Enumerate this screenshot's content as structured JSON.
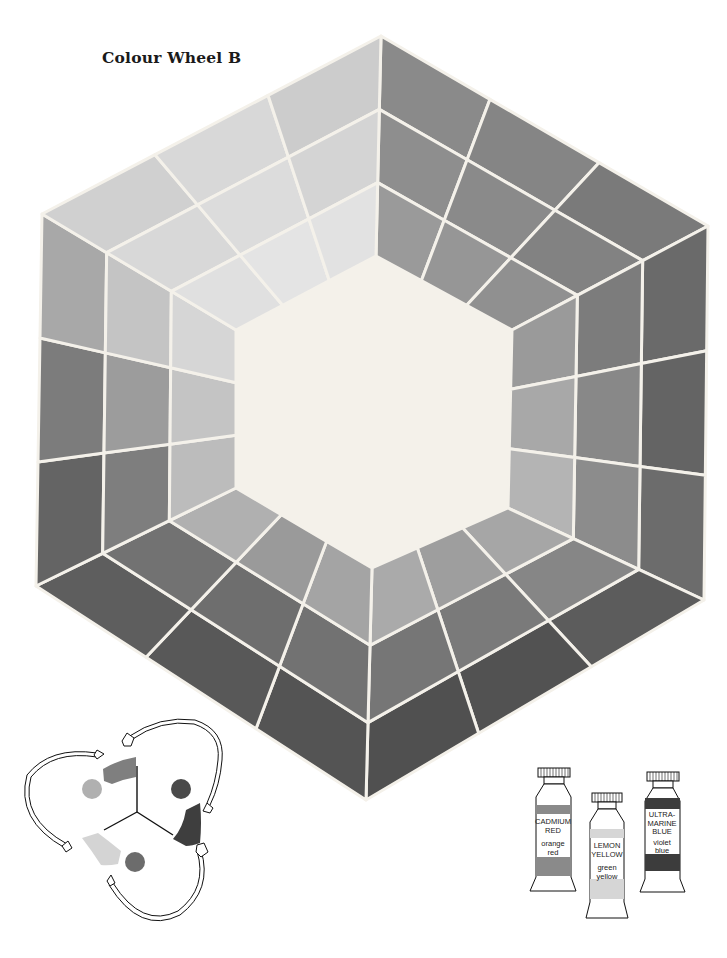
{
  "title": "Colour Wheel B",
  "wheel": {
    "outer_vertices": [
      [
        381,
        36
      ],
      [
        708,
        226
      ],
      [
        704,
        600
      ],
      [
        366,
        800
      ],
      [
        36,
        586
      ],
      [
        42,
        214
      ]
    ],
    "inner_vertices": [
      [
        376,
        256
      ],
      [
        512,
        330
      ],
      [
        508,
        508
      ],
      [
        372,
        568
      ],
      [
        236,
        488
      ],
      [
        236,
        330
      ]
    ],
    "rings": 3,
    "cells_per_side": 3,
    "gap_color": "#f4f1ea",
    "cell_grays": [
      [
        "#8a8a8a",
        "#8e8e8e",
        "#9a9a9a"
      ],
      [
        "#858585",
        "#8a8a8a",
        "#969696"
      ],
      [
        "#7a7a7a",
        "#828282",
        "#909090"
      ],
      [
        "#6a6a6a",
        "#7c7c7c",
        "#9a9a9a"
      ],
      [
        "#646464",
        "#888888",
        "#a8a8a8"
      ],
      [
        "#6c6c6c",
        "#8c8c8c",
        "#b4b4b4"
      ],
      [
        "#5c5c5c",
        "#868686",
        "#a6a6a6"
      ],
      [
        "#525252",
        "#7a7a7a",
        "#9e9e9e"
      ],
      [
        "#505050",
        "#767676",
        "#aaaaaa"
      ],
      [
        "#545454",
        "#727272",
        "#a4a4a4"
      ],
      [
        "#585858",
        "#6e6e6e",
        "#9a9a9a"
      ],
      [
        "#5e5e5e",
        "#727272",
        "#b0b0b0"
      ],
      [
        "#646464",
        "#7e7e7e",
        "#bcbcbc"
      ],
      [
        "#7c7c7c",
        "#9c9c9c",
        "#c4c4c4"
      ],
      [
        "#a8a8a8",
        "#c4c4c4",
        "#d6d6d6"
      ],
      [
        "#d0d0d0",
        "#d8d8d8",
        "#e0e0e0"
      ],
      [
        "#d8d8d8",
        "#dcdcdc",
        "#e4e4e4"
      ],
      [
        "#cccccc",
        "#d4d4d4",
        "#e2e2e2"
      ]
    ],
    "left_side_grays": [
      [
        "#8c8c8c",
        "#989898",
        "#a6a6a6"
      ],
      [
        "#8a8a8a",
        "#9e9e9e",
        "#b2b2b2"
      ],
      [
        "#929292",
        "#a4a4a4",
        "#c4c4c4"
      ]
    ]
  },
  "legend_diagram": {
    "swatches": [
      {
        "name": "orange-red-swatch",
        "color": "#7f7f7f"
      },
      {
        "name": "violet-blue-swatch",
        "color": "#3e3e3e"
      },
      {
        "name": "green-yellow-swatch",
        "color": "#d4d4d4"
      }
    ],
    "dots": [
      {
        "name": "orange-dot",
        "color": "#b0b0b0"
      },
      {
        "name": "violet-dot",
        "color": "#4a4a4a"
      },
      {
        "name": "green-dot",
        "color": "#6c6c6c"
      }
    ]
  },
  "tubes": [
    {
      "name": "CADMIUM RED",
      "lines": [
        "CADMIUM",
        "RED"
      ],
      "hue_lines": [
        "orange",
        "red"
      ],
      "band_color": "#8a8a8a"
    },
    {
      "name": "LEMON YELLOW",
      "lines": [
        "LEMON",
        "YELLOW"
      ],
      "hue_lines": [
        "green",
        "yellow"
      ],
      "band_color": "#d6d6d6"
    },
    {
      "name": "ULTRAMARINE BLUE",
      "lines": [
        "ULTRA-",
        "MARINE",
        "BLUE"
      ],
      "hue_lines": [
        "violet",
        "blue"
      ],
      "band_color": "#3c3c3c"
    }
  ]
}
